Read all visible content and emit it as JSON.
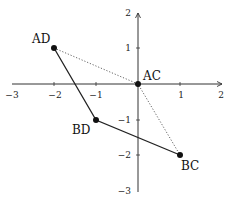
{
  "diagram": {
    "title": "",
    "axes": {
      "x_ticks": [
        "−3",
        "−2",
        "−1",
        "1",
        "2"
      ],
      "y_ticks": [
        "2",
        "1",
        "−1",
        "−2",
        "−3"
      ],
      "xlim": [
        -3,
        2
      ],
      "ylim": [
        -3,
        2
      ]
    },
    "points": [
      {
        "label": "AD",
        "x": -2,
        "y": 1
      },
      {
        "label": "AC",
        "x": 0,
        "y": 0
      },
      {
        "label": "BD",
        "x": -1,
        "y": -1
      },
      {
        "label": "BC",
        "x": 1,
        "y": -2
      }
    ],
    "solid_path": [
      "AD",
      "BD",
      "BC"
    ],
    "dotted_path": [
      "AD",
      "AC",
      "BC"
    ],
    "colors": {
      "axis": "#333333",
      "solid": "#222222",
      "dotted": "#555555",
      "point": "#111111"
    }
  }
}
